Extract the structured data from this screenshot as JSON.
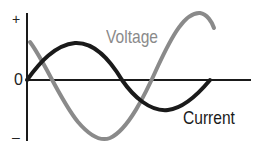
{
  "diagram": {
    "type": "line",
    "axis": {
      "y_top_label": "+",
      "y_zero_label": "0",
      "y_bottom_label": "–"
    },
    "series": [
      {
        "name": "Voltage",
        "label": "Voltage",
        "color": "#8a8a8a"
      },
      {
        "name": "Current",
        "label": "Current",
        "color": "#1a1a1a"
      }
    ],
    "colors": {
      "axis": "#1a1a1a",
      "voltage": "#8a8a8a",
      "current": "#1a1a1a"
    }
  }
}
